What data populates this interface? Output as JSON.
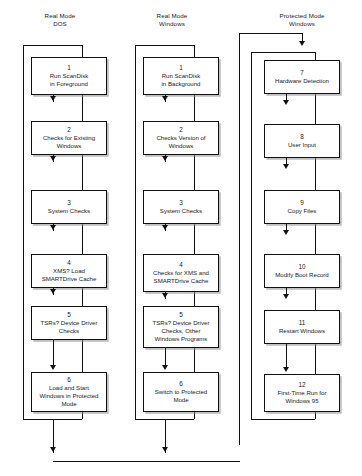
{
  "diagram": {
    "width": 362,
    "height": 476,
    "line_color": "#111111",
    "box_fill": "#ffffff",
    "shadow_color": "#8c8c8c"
  },
  "columns": [
    {
      "id": "real-mode-dos",
      "header": "Real Mode\nDOS"
    },
    {
      "id": "real-mode-windows",
      "header": "Real Mode\nWindows"
    },
    {
      "id": "protected-mode-windows",
      "header": "Protected Mode\nWindows"
    }
  ],
  "nodes": {
    "col1": [
      {
        "num": "1",
        "label": "Run ScanDisk\nin Foreground"
      },
      {
        "num": "2",
        "label": "Checks for Existing\nWindows"
      },
      {
        "num": "3",
        "label": "System Checks"
      },
      {
        "num": "4",
        "label": "XMS? Load\nSMARTDrive Cache"
      },
      {
        "num": "5",
        "label": "TSRs? Device Driver\nChecks"
      },
      {
        "num": "6",
        "label": "Load and Start\nWindows in Protected\nMode"
      }
    ],
    "col2": [
      {
        "num": "1",
        "label": "Run ScanDisk\nin Background"
      },
      {
        "num": "2",
        "label": "Checks Version of\nWindows"
      },
      {
        "num": "3",
        "label": "System Checks"
      },
      {
        "num": "4",
        "label": "Checks for XMS and\nSMARTDrive Cache"
      },
      {
        "num": "5",
        "label": "TSRs? Device Driver\nChecks, Other\nWindows Programs"
      },
      {
        "num": "6",
        "label": "Switch to Protected\nMode"
      }
    ],
    "col3": [
      {
        "num": "7",
        "label": "Hardware Detection"
      },
      {
        "num": "8",
        "label": "User Input"
      },
      {
        "num": "9",
        "label": "Copy Files"
      },
      {
        "num": "10",
        "label": "Modify Boot Record"
      },
      {
        "num": "11",
        "label": "Restart Windows"
      },
      {
        "num": "12",
        "label": "First-Time Run for\nWindows 95"
      }
    ]
  }
}
